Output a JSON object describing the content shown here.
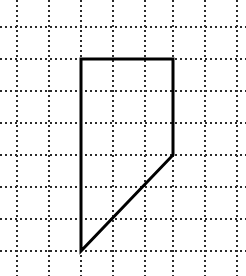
{
  "figure": {
    "background_color": "#ffffff",
    "width": 246,
    "height": 276
  },
  "grid": {
    "style": "dotted",
    "color": "#2b2b2b",
    "line_width": 2,
    "dash_pattern": "2 3",
    "spacing": 32,
    "vertical_line_x": [
      17,
      49,
      81,
      113,
      145,
      173,
      205,
      237
    ],
    "horizontal_line_y": [
      27,
      59,
      91,
      123,
      155,
      187,
      219,
      251
    ]
  },
  "shape": {
    "name": "quadrilateral",
    "stroke_color": "#000000",
    "stroke_width": 3,
    "fill": "none",
    "vertices": [
      {
        "label": "top-left",
        "x": 81,
        "y": 59
      },
      {
        "label": "top-right",
        "x": 173,
        "y": 59
      },
      {
        "label": "right-lower",
        "x": 173,
        "y": 155
      },
      {
        "label": "bottom-left",
        "x": 81,
        "y": 251
      }
    ],
    "edges": [
      {
        "name": "top-edge",
        "from": "top-left",
        "to": "top-right",
        "orientation": "horizontal"
      },
      {
        "name": "right-edge",
        "from": "top-right",
        "to": "right-lower",
        "orientation": "vertical"
      },
      {
        "name": "diagonal-edge",
        "from": "right-lower",
        "to": "bottom-left",
        "orientation": "diagonal"
      },
      {
        "name": "left-edge",
        "from": "bottom-left",
        "to": "top-left",
        "orientation": "vertical"
      }
    ],
    "path_d": "M 81 59 L 173 59 L 173 155 L 81 251 Z"
  }
}
